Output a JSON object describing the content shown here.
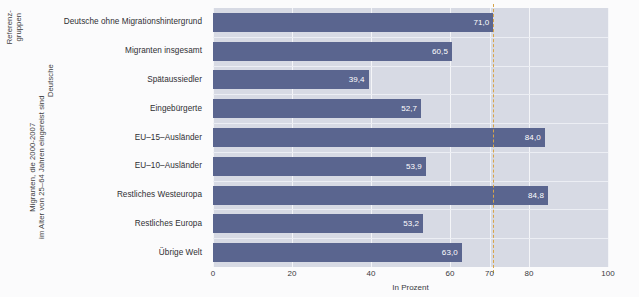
{
  "group_labels": {
    "reference": "Referenz-\ngruppen",
    "reference_line1": "Referenz-",
    "reference_line2": "gruppen",
    "germans": "Deutsche",
    "migrants_line1": "Migranten, die 2000-2007",
    "migrants_line2": "im Alter von 25–64 Jahren eingereist sind"
  },
  "chart_data": {
    "type": "bar",
    "orientation": "horizontal",
    "title": "",
    "subtitle": "",
    "xlabel": "In Prozent",
    "ylabel": "",
    "xlim": [
      0,
      100
    ],
    "xticks": [
      0,
      20,
      40,
      60,
      70,
      80,
      100
    ],
    "xticklabels": [
      "0",
      "20",
      "40",
      "60",
      "70",
      "80",
      "100"
    ],
    "grid": true,
    "legend": "none",
    "categories": [
      "Deutsche ohne Migrationshintergrund",
      "Migranten insgesamt",
      "Spätaussiedler",
      "Eingebürgerte",
      "EU–15–Ausländer",
      "EU–10–Ausländer",
      "Restliches Westeuropa",
      "Restliches Europa",
      "Übrige Welt"
    ],
    "values": [
      71.0,
      60.5,
      39.4,
      52.7,
      84.0,
      53.9,
      84.8,
      53.2,
      63.0
    ],
    "value_labels": [
      "71,0",
      "60,5",
      "39,4",
      "52,7",
      "84,0",
      "53,9",
      "84,8",
      "53,2",
      "63,0"
    ],
    "bar_color": "#5a658f",
    "panel_color": "#d7dae4",
    "gridline_color": "#f4f5f8",
    "value_label_color": "#ffffff",
    "reference_line": {
      "value": 71.0,
      "style": "dashed",
      "color": "#d7a54a"
    }
  }
}
